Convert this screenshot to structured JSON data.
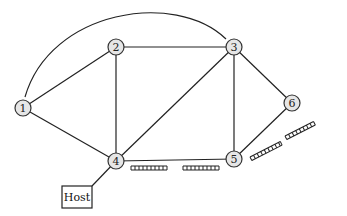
{
  "diagram": {
    "type": "network-graph",
    "nodes": [
      {
        "id": "1",
        "label": "1",
        "x": 23,
        "y": 108
      },
      {
        "id": "2",
        "label": "2",
        "x": 116,
        "y": 47
      },
      {
        "id": "3",
        "label": "3",
        "x": 234,
        "y": 47
      },
      {
        "id": "4",
        "label": "4",
        "x": 116,
        "y": 161
      },
      {
        "id": "5",
        "label": "5",
        "x": 234,
        "y": 159
      },
      {
        "id": "6",
        "label": "6",
        "x": 292,
        "y": 103
      }
    ],
    "edges": [
      {
        "from": "1",
        "to": "2"
      },
      {
        "from": "1",
        "to": "4"
      },
      {
        "from": "1",
        "to": "3",
        "curved": true
      },
      {
        "from": "2",
        "to": "3"
      },
      {
        "from": "2",
        "to": "4"
      },
      {
        "from": "3",
        "to": "4"
      },
      {
        "from": "3",
        "to": "5"
      },
      {
        "from": "3",
        "to": "6"
      },
      {
        "from": "4",
        "to": "5"
      },
      {
        "from": "5",
        "to": "6"
      },
      {
        "from": "4",
        "to": "Host"
      }
    ],
    "host": {
      "label": "Host",
      "x": 62,
      "y": 186,
      "width": 30,
      "height": 22
    },
    "queues": [
      {
        "edge": "4-5",
        "position": "near-4"
      },
      {
        "edge": "4-5",
        "position": "near-5"
      },
      {
        "edge": "5-6",
        "position": "near-5"
      },
      {
        "edge": "5-6",
        "position": "near-6"
      }
    ]
  }
}
